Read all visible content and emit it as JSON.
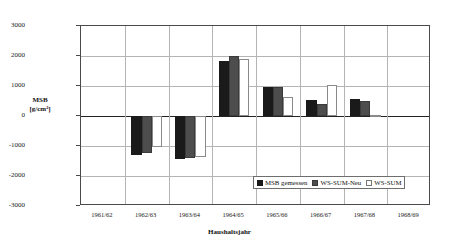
{
  "chart_data": {
    "type": "bar",
    "title": "",
    "xlabel": "Haushaltsjahr",
    "ylabel": "MSB\n[g/cm²]",
    "ylabel_line1": "MSB",
    "ylabel_line2": "[g/cm²]",
    "ylim": [
      -3000,
      3000
    ],
    "yticks": [
      3000,
      2000,
      1000,
      0,
      -1000,
      -2000,
      -3000
    ],
    "ytick_labels": [
      "3000",
      "2000",
      "1000",
      "0",
      "-1000",
      "-2000",
      "-3000"
    ],
    "grid": true,
    "legend_position": "inside-bottom-right",
    "categories": [
      "1961/62",
      "1962/63",
      "1963/64",
      "1964/65",
      "1965/66",
      "1966/67",
      "1967/68",
      "1968/69"
    ],
    "series": [
      {
        "name": "MSB gemessen",
        "color": "#1a1a1a",
        "values": [
          null,
          -1310,
          -1420,
          1850,
          970,
          540,
          580,
          null
        ]
      },
      {
        "name": "WS-SUM-Neu",
        "color": "#4d4d4d",
        "values": [
          null,
          -1230,
          -1400,
          2000,
          970,
          400,
          490,
          null
        ]
      },
      {
        "name": "WS-SUM",
        "color": "#ffffff",
        "values": [
          null,
          -1020,
          -1350,
          1900,
          620,
          1050,
          30,
          null
        ]
      }
    ]
  },
  "legend": {
    "entries": [
      {
        "label": "MSB gemessen"
      },
      {
        "label": "WS-SUM-Neu"
      },
      {
        "label": "WS-SUM"
      }
    ]
  }
}
